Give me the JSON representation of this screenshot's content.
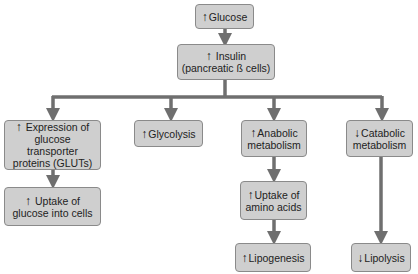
{
  "diagram": {
    "colors": {
      "box_fill": "#cfcfcf",
      "box_border": "#8a8a8a",
      "connector": "#6f6f6f"
    },
    "nodes": {
      "glucose": {
        "arrow": "↑",
        "lines": [
          "Glucose"
        ]
      },
      "insulin": {
        "arrow": "↑",
        "lines": [
          "Insulin",
          "(pancreatic ß cells)"
        ]
      },
      "expression": {
        "arrow": "↑",
        "lines": [
          "Expression of",
          "glucose transporter",
          "proteins (GLUTs)"
        ]
      },
      "uptake_glucose": {
        "arrow": "↑",
        "lines": [
          "Uptake of",
          "glucose into cells"
        ]
      },
      "glycolysis": {
        "arrow": "↑",
        "lines": [
          "Glycolysis"
        ]
      },
      "anabolic": {
        "arrow": "↑",
        "lines": [
          "Anabolic",
          "metabolism"
        ]
      },
      "uptake_amino": {
        "arrow": "↑",
        "lines": [
          "Uptake of",
          "amino acids"
        ]
      },
      "lipogenesis": {
        "arrow": "↑",
        "lines": [
          "Lipogenesis"
        ]
      },
      "catabolic": {
        "arrow": "↓",
        "lines": [
          "Catabolic",
          "metabolism"
        ]
      },
      "lipolysis": {
        "arrow": "↓",
        "lines": [
          "Lipolysis"
        ]
      }
    },
    "edges": [
      [
        "glucose",
        "insulin"
      ],
      [
        "insulin",
        "expression"
      ],
      [
        "insulin",
        "glycolysis"
      ],
      [
        "insulin",
        "anabolic"
      ],
      [
        "insulin",
        "catabolic"
      ],
      [
        "expression",
        "uptake_glucose"
      ],
      [
        "anabolic",
        "uptake_amino"
      ],
      [
        "uptake_amino",
        "lipogenesis"
      ],
      [
        "catabolic",
        "lipolysis"
      ]
    ]
  }
}
